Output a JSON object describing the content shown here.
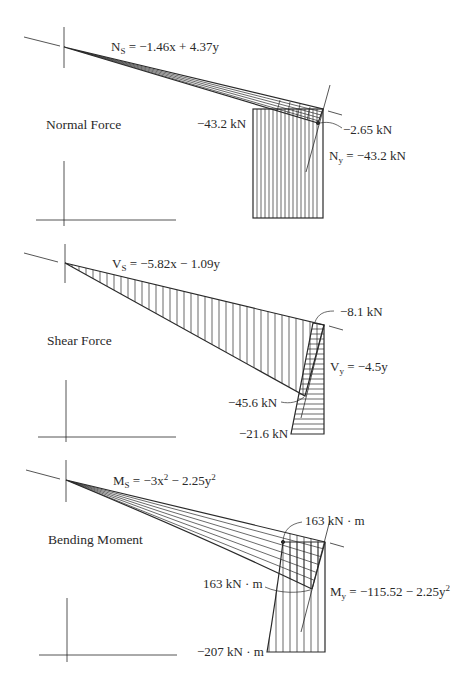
{
  "diagram": {
    "colors": {
      "ink": "#2a2a2a",
      "thin": "#555555",
      "background": "#ffffff"
    },
    "sections": [
      {
        "id": "normal",
        "title": "Normal Force",
        "sloped_equation": {
          "symbol": "N",
          "subscript": "S",
          "rhs": " = −1.46x + 4.37y"
        },
        "vertical_equation": {
          "symbol": "N",
          "subscript": "y",
          "rhs": " = −43.2 kN"
        },
        "values": {
          "left_value": "−43.2 kN",
          "joint_value": "−2.65 kN"
        }
      },
      {
        "id": "shear",
        "title": "Shear Force",
        "sloped_equation": {
          "symbol": "V",
          "subscript": "S",
          "rhs": " = −5.82x − 1.09y"
        },
        "vertical_equation": {
          "symbol": "V",
          "subscript": "y",
          "rhs": " = −4.5y"
        },
        "values": {
          "top_value": "−8.1 kN",
          "mid_value": "−45.6 kN",
          "bottom_value": "−21.6 kN"
        }
      },
      {
        "id": "moment",
        "title": "Bending Moment",
        "sloped_equation": {
          "symbol": "M",
          "subscript": "S",
          "rhs_a": " = −3x",
          "sup_a": "2",
          "rhs_b": " − 2.25y",
          "sup_b": "2"
        },
        "vertical_equation": {
          "symbol": "M",
          "subscript": "y",
          "rhs_a": " = −115.52 − 2.25y",
          "sup_a": "2"
        },
        "values": {
          "top_value": "163 kN · m",
          "mid_value": "163 kN · m",
          "bottom_value": "−207 kN · m"
        }
      }
    ]
  }
}
